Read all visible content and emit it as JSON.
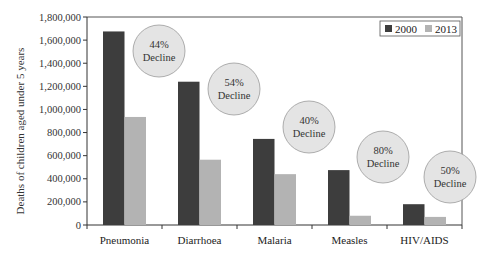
{
  "chart_data": {
    "type": "bar",
    "title": "",
    "xlabel": "",
    "ylabel": "Deaths of children aged under 5 years",
    "ylim": [
      0,
      1800000
    ],
    "yticks": [
      0,
      200000,
      400000,
      600000,
      800000,
      1000000,
      1200000,
      1400000,
      1600000,
      1800000
    ],
    "ytick_labels": [
      "0",
      "200,000",
      "400,000",
      "600,000",
      "800,000",
      "1,000,000",
      "1,200,000",
      "1,400,000",
      "1,600,000",
      "1,800,000"
    ],
    "categories": [
      "Pneumonia",
      "Diarrhoea",
      "Malaria",
      "Measles",
      "HIV/AIDS"
    ],
    "series": [
      {
        "name": "2000",
        "color": "#3d3d3d",
        "values": [
          1675000,
          1240000,
          745000,
          475000,
          180000
        ]
      },
      {
        "name": "2013",
        "color": "#b3b3b3",
        "values": [
          935000,
          565000,
          440000,
          80000,
          70000
        ]
      }
    ],
    "annotations": [
      {
        "category": "Pneumonia",
        "line1": "44%",
        "line2": "Decline"
      },
      {
        "category": "Diarrhoea",
        "line1": "54%",
        "line2": "Decline"
      },
      {
        "category": "Malaria",
        "line1": "40%",
        "line2": "Decline"
      },
      {
        "category": "Measles",
        "line1": "80%",
        "line2": "Decline"
      },
      {
        "category": "HIV/AIDS",
        "line1": "50%",
        "line2": "Decline"
      }
    ],
    "legend": {
      "position": "top-right",
      "entries": [
        "2000",
        "2013"
      ]
    },
    "grid": false,
    "bubble_color": "#e4e4e4"
  }
}
